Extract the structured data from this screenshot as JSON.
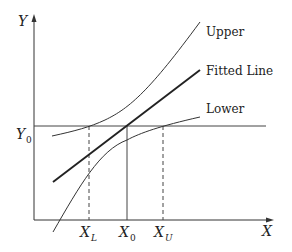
{
  "diagram": {
    "type": "calibration / inverse prediction diagram",
    "axes": {
      "x_label": "X",
      "y_label": "Y"
    },
    "curves": [
      {
        "id": "upper",
        "label": "Upper",
        "style": "thin"
      },
      {
        "id": "fitted",
        "label": "Fitted Line",
        "style": "thick"
      },
      {
        "id": "lower",
        "label": "Lower",
        "style": "thin"
      }
    ],
    "reference_line": {
      "label": "Y",
      "subscript": "0"
    },
    "x_markers": [
      {
        "id": "xl",
        "label": "X",
        "subscript": "L",
        "style": "dashed"
      },
      {
        "id": "x0",
        "label": "X",
        "subscript": "0",
        "style": "solid"
      },
      {
        "id": "xu",
        "label": "X",
        "subscript": "U",
        "style": "dashed"
      }
    ],
    "colors": {
      "line": "#222222",
      "background": "#ffffff"
    }
  }
}
